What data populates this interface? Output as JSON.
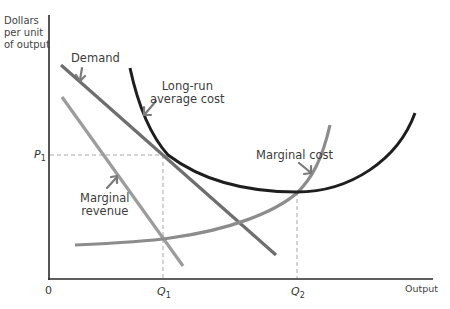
{
  "diagram": {
    "type": "economics-cost-revenue-diagram",
    "y_axis_label": [
      "Dollars",
      "per unit",
      "of output"
    ],
    "x_axis_label": "Output",
    "origin_label": "0",
    "price_tick": {
      "letter": "P",
      "sub": "1"
    },
    "quantity_ticks": [
      {
        "letter": "Q",
        "sub": "1"
      },
      {
        "letter": "Q",
        "sub": "2"
      }
    ],
    "curves": {
      "demand": {
        "label": "Demand",
        "color": "#6e6e6e"
      },
      "marginal_revenue": {
        "label_line1": "Marginal",
        "label_line2": "revenue",
        "color": "#9c9c9c"
      },
      "long_run_average_cost": {
        "label_line1": "Long-run",
        "label_line2": "average cost",
        "color": "#1e1e1e"
      },
      "marginal_cost": {
        "label": "Marginal cost",
        "color": "#8c8c8c"
      }
    },
    "guide_color": "#a8a8a8",
    "axis_color": "#2a2a2a",
    "arrow_color": "#7a7a7a"
  }
}
